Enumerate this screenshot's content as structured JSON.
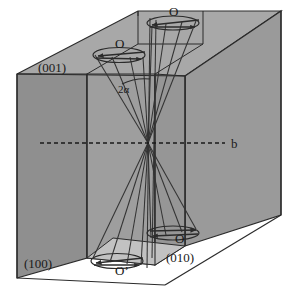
{
  "figure": {
    "background_color": "#ffffff",
    "line_color": "#2b2b2b",
    "colors": {
      "face_dark": "#8f8f8f",
      "face_mid": "#9a9a9a",
      "face_light": "#a8a8a8",
      "face_pale": "#c2c2c2",
      "outline": "#2b2b2b",
      "text": "#1a1a1a"
    }
  },
  "faces": [
    {
      "id": "face-001",
      "label": "(001)",
      "plane": "top back face",
      "shade": "#9a9a9a"
    },
    {
      "id": "face-100",
      "label": "(100)",
      "plane": "left side face",
      "shade": "#8f8f8f"
    },
    {
      "id": "face-010",
      "label": "(010)",
      "plane": "front right face",
      "shade": "#9a9a9a"
    }
  ],
  "axes": {
    "b_label": "b",
    "b_style": "dashed horizontal line through centre"
  },
  "angle": {
    "label": "2α",
    "meaning": "optic axial angle between the two optic axes"
  },
  "melatopes": [
    {
      "id": "melatope-top-left",
      "label": "O",
      "position": "upper left exit point"
    },
    {
      "id": "melatope-top-right",
      "label": "O",
      "position": "upper right exit point"
    },
    {
      "id": "melatope-bottom-left",
      "label": "O’",
      "position": "lower left exit point"
    },
    {
      "id": "melatope-bottom-right",
      "label": "O",
      "position": "lower right exit point"
    }
  ],
  "annotations": {
    "rotation_arrows": "curved arrows indicating rotation about each optic axis",
    "ray_bundles": "two converging cones of optic-axis rays crossing at the crystal centre"
  }
}
